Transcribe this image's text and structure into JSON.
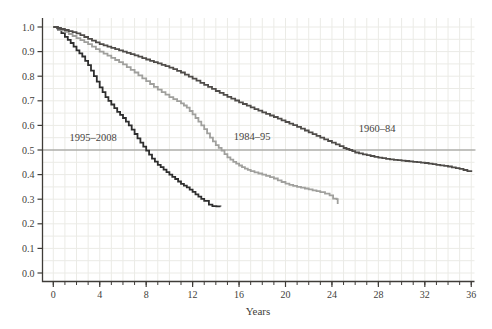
{
  "chart_data": {
    "type": "line",
    "subtype": "kaplan-meier-step-survival",
    "title": "",
    "xlabel": "Years",
    "ylabel": "",
    "xlim": [
      0,
      36
    ],
    "ylim": [
      0.0,
      1.0
    ],
    "x_major_ticks": [
      0,
      4,
      8,
      12,
      16,
      20,
      24,
      28,
      32,
      36
    ],
    "x_minor_tick_step": 1,
    "y_ticks": [
      "0.0",
      "0.1",
      "0.2",
      "0.3",
      "0.4",
      "0.5",
      "0.6",
      "0.7",
      "0.8",
      "0.9",
      "1.0"
    ],
    "grid": {
      "on": true,
      "x_step_years": 1,
      "y_step": 0.05,
      "color": "#ebebe6"
    },
    "reference_line": {
      "y": 0.5,
      "color": "#90908c"
    },
    "axis_color": "#3f3c38",
    "legend_position": "inline-annotations",
    "series": [
      {
        "name": "1995–2008",
        "color": "#2e2e2e",
        "points": [
          [
            0,
            1.0
          ],
          [
            0.4,
            0.99
          ],
          [
            1,
            0.96
          ],
          [
            1.5,
            0.935
          ],
          [
            2,
            0.905
          ],
          [
            2.5,
            0.88
          ],
          [
            3,
            0.845
          ],
          [
            3.5,
            0.8
          ],
          [
            4,
            0.755
          ],
          [
            4.5,
            0.715
          ],
          [
            5,
            0.685
          ],
          [
            5.5,
            0.655
          ],
          [
            6,
            0.63
          ],
          [
            6.5,
            0.6
          ],
          [
            7,
            0.565
          ],
          [
            7.5,
            0.53
          ],
          [
            8,
            0.497
          ],
          [
            8.5,
            0.465
          ],
          [
            9,
            0.44
          ],
          [
            9.5,
            0.42
          ],
          [
            10,
            0.4
          ],
          [
            10.5,
            0.382
          ],
          [
            11,
            0.362
          ],
          [
            11.5,
            0.348
          ],
          [
            12,
            0.33
          ],
          [
            12.5,
            0.31
          ],
          [
            13,
            0.293
          ],
          [
            13.4,
            0.278
          ],
          [
            13.7,
            0.272
          ],
          [
            14.4,
            0.27
          ]
        ],
        "median_years": 8.0,
        "end": {
          "year": 14.4,
          "survival": 0.27
        }
      },
      {
        "name": "1984–95",
        "color": "#a0a09d",
        "points": [
          [
            0,
            1.0
          ],
          [
            1,
            0.98
          ],
          [
            2,
            0.955
          ],
          [
            3,
            0.93
          ],
          [
            4,
            0.9
          ],
          [
            5,
            0.875
          ],
          [
            6,
            0.848
          ],
          [
            7,
            0.815
          ],
          [
            8,
            0.78
          ],
          [
            9,
            0.745
          ],
          [
            10,
            0.715
          ],
          [
            11,
            0.69
          ],
          [
            11.5,
            0.672
          ],
          [
            12,
            0.645
          ],
          [
            12.5,
            0.615
          ],
          [
            13,
            0.585
          ],
          [
            13.5,
            0.55
          ],
          [
            14,
            0.52
          ],
          [
            14.5,
            0.497
          ],
          [
            15,
            0.47
          ],
          [
            15.5,
            0.452
          ],
          [
            16,
            0.437
          ],
          [
            16.5,
            0.424
          ],
          [
            17,
            0.414
          ],
          [
            18,
            0.4
          ],
          [
            19,
            0.384
          ],
          [
            20,
            0.363
          ],
          [
            21,
            0.35
          ],
          [
            22,
            0.34
          ],
          [
            23,
            0.329
          ],
          [
            23.8,
            0.316
          ],
          [
            24.1,
            0.302
          ],
          [
            24.4,
            0.3
          ],
          [
            24.5,
            0.28
          ]
        ],
        "median_years": 14.5,
        "end": {
          "year": 24.5,
          "survival": 0.28
        }
      },
      {
        "name": "1960–84",
        "color": "#4f4c49",
        "points": [
          [
            0,
            1.0
          ],
          [
            1,
            0.988
          ],
          [
            2,
            0.974
          ],
          [
            3,
            0.952
          ],
          [
            4,
            0.93
          ],
          [
            5,
            0.915
          ],
          [
            6,
            0.9
          ],
          [
            7,
            0.885
          ],
          [
            8,
            0.868
          ],
          [
            9,
            0.852
          ],
          [
            10,
            0.835
          ],
          [
            11,
            0.815
          ],
          [
            12,
            0.79
          ],
          [
            13,
            0.765
          ],
          [
            14,
            0.74
          ],
          [
            15,
            0.716
          ],
          [
            16,
            0.694
          ],
          [
            17,
            0.673
          ],
          [
            18,
            0.653
          ],
          [
            19,
            0.634
          ],
          [
            20,
            0.614
          ],
          [
            21,
            0.594
          ],
          [
            22,
            0.572
          ],
          [
            23,
            0.55
          ],
          [
            24,
            0.53
          ],
          [
            25,
            0.508
          ],
          [
            25.5,
            0.5
          ],
          [
            26,
            0.49
          ],
          [
            27,
            0.479
          ],
          [
            28,
            0.469
          ],
          [
            29,
            0.462
          ],
          [
            30,
            0.457
          ],
          [
            31,
            0.452
          ],
          [
            32,
            0.447
          ],
          [
            33,
            0.44
          ],
          [
            34,
            0.433
          ],
          [
            35,
            0.423
          ],
          [
            36,
            0.41
          ]
        ],
        "median_years": 25.5,
        "end": {
          "year": 36,
          "survival": 0.41
        }
      }
    ]
  }
}
